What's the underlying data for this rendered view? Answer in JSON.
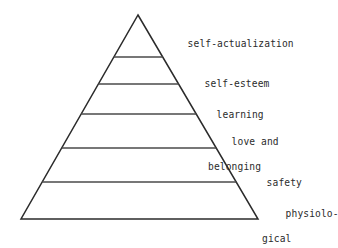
{
  "diagram": {
    "background_color": "#ffffff",
    "stroke_color": "#2b2b2b",
    "text_color": "#2b2b2b",
    "shape": "triangle",
    "apex": {
      "x": 138,
      "y": 15
    },
    "base_left": {
      "x": 21,
      "y": 219
    },
    "base_right": {
      "x": 258,
      "y": 219
    },
    "divider_y": [
      57,
      84,
      114,
      148,
      182
    ],
    "tiers": [
      {
        "index": 1,
        "label": "self-actualization",
        "label_line1": "self-actualization",
        "label_line2": "",
        "label_x": 164,
        "label_y": 25
      },
      {
        "index": 2,
        "label": "self-esteem",
        "label_line1": "self-esteem",
        "label_line2": "",
        "label_x": 181,
        "label_y": 65
      },
      {
        "index": 3,
        "label": "learning",
        "label_line1": "learning",
        "label_line2": "",
        "label_x": 193,
        "label_y": 96
      },
      {
        "index": 4,
        "label": "love and belonging",
        "label_line1": "love and",
        "label_line2": "belonging",
        "label_x": 208,
        "label_y": 123
      },
      {
        "index": 5,
        "label": "safety",
        "label_line1": "safety",
        "label_line2": "",
        "label_x": 243,
        "label_y": 164
      },
      {
        "index": 6,
        "label": "physiological",
        "label_line1": "physiolo-",
        "label_line2": "gical",
        "label_x": 262,
        "label_y": 195
      }
    ]
  }
}
